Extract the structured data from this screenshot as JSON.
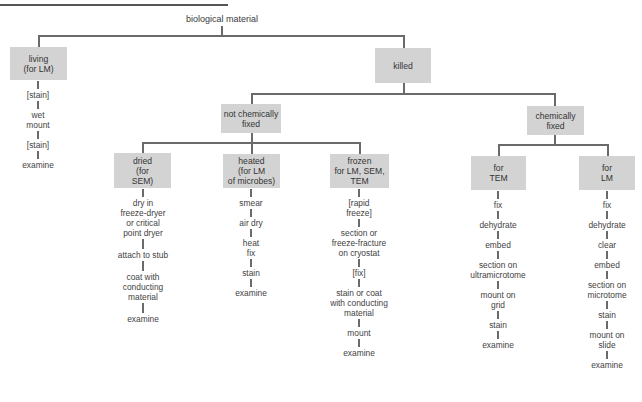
{
  "root": {
    "label": "biological material"
  },
  "level1": [
    {
      "id": "living",
      "label": "living\n(for LM)"
    },
    {
      "id": "killed",
      "label": "killed"
    }
  ],
  "level2": [
    {
      "id": "not-chemically-fixed",
      "label": "not chemically\nfixed"
    },
    {
      "id": "chemically-fixed",
      "label": "chemically\nfixed"
    }
  ],
  "level3": [
    {
      "id": "dried",
      "label": "dried\n(for\nSEM)"
    },
    {
      "id": "heated",
      "label": "heated\n(for LM\nof microbes)"
    },
    {
      "id": "frozen",
      "label": "frozen\nfor LM, SEM,\nTEM"
    },
    {
      "id": "for-tem",
      "label": "for\nTEM"
    },
    {
      "id": "for-lm",
      "label": "for\nLM"
    }
  ],
  "steps": {
    "living": [
      "[stain]",
      "wet\nmount",
      "[stain]",
      "examine"
    ],
    "dried": [
      "dry in\nfreeze-dryer\nor critical\npoint dryer",
      "attach to stub",
      "coat with\nconducting\nmaterial",
      "examine"
    ],
    "heated": [
      "smear",
      "air dry",
      "heat\nfix",
      "stain",
      "examine"
    ],
    "frozen": [
      "[rapid\nfreeze]",
      "section or\nfreeze-fracture\non cryostat",
      "[fix]",
      "stain or coat\nwith conducting\nmaterial",
      "mount",
      "examine"
    ],
    "for_tem": [
      "fix",
      "dehydrate",
      "embed",
      "section on\nultramicrotome",
      "mount on\ngrid",
      "stain",
      "examine"
    ],
    "for_lm": [
      "fix",
      "dehydrate",
      "clear",
      "embed",
      "section on\nmicrotome",
      "stain",
      "mount on\nslide",
      "examine"
    ]
  },
  "colors": {
    "box_fill": "#d3d3d3",
    "line": "#6a6a6a",
    "text": "#3a3a3a"
  }
}
